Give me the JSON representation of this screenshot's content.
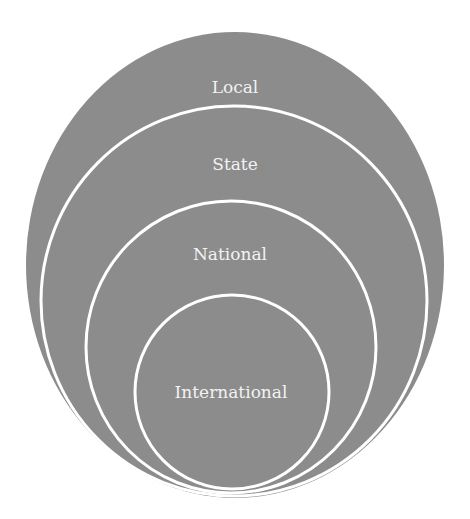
{
  "diagram": {
    "type": "nested-circles",
    "colors": {
      "fill": "#8c8c8c",
      "stroke": "#ffffff",
      "background": "#ffffff",
      "text": "#f2f2f2"
    },
    "levels": [
      {
        "label": "Local"
      },
      {
        "label": "State"
      },
      {
        "label": "National"
      },
      {
        "label": "International"
      }
    ]
  }
}
